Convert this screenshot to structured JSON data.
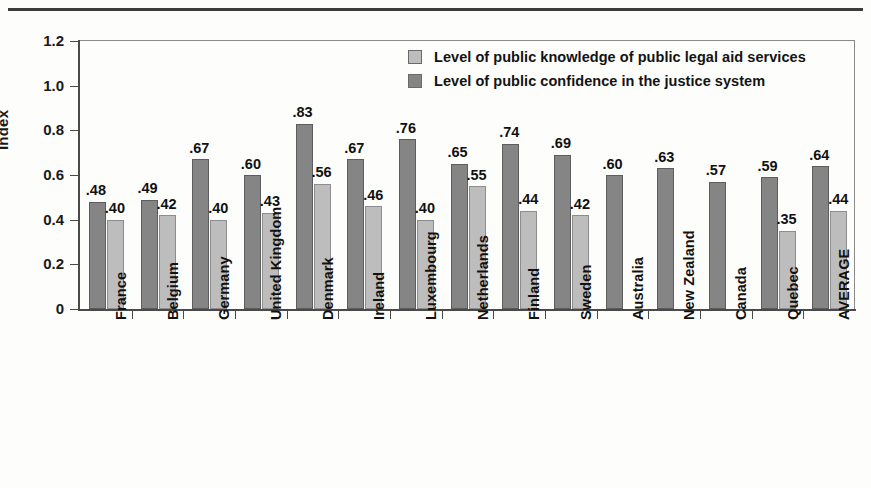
{
  "chart_data": {
    "type": "bar",
    "title": "",
    "xlabel": "",
    "ylabel": "Index",
    "ylim": [
      0,
      1.2
    ],
    "yticks": [
      "0",
      "0.2",
      "0.4",
      "0.6",
      "0.8",
      "1.0",
      "1.2"
    ],
    "ytick_values": [
      0,
      0.2,
      0.4,
      0.6,
      0.8,
      1.0,
      1.2
    ],
    "grid": false,
    "legend_position": "top-right",
    "categories": [
      "France",
      "Belgium",
      "Germany",
      "United Kingdom",
      "Denmark",
      "Ireland",
      "Luxembourg",
      "Netherlands",
      "Finland",
      "Sweden",
      "Australia",
      "New Zealand",
      "Canada",
      "Quebec",
      "AVERAGE"
    ],
    "series": [
      {
        "name": "Level of public confidence in the justice system",
        "color": "#858585",
        "values": [
          0.48,
          0.49,
          0.67,
          0.6,
          0.83,
          0.67,
          0.76,
          0.65,
          0.74,
          0.69,
          0.6,
          0.63,
          0.57,
          0.59,
          0.64
        ],
        "labels": [
          ".48",
          ".49",
          ".67",
          ".60",
          ".83",
          ".67",
          ".76",
          ".65",
          ".74",
          ".69",
          ".60",
          ".63",
          ".57",
          ".59",
          ".64"
        ]
      },
      {
        "name": "Level of public knowledge of public legal aid services",
        "color": "#bdbdbd",
        "values": [
          0.4,
          0.42,
          0.4,
          0.43,
          0.56,
          0.46,
          0.4,
          0.55,
          0.44,
          0.42,
          null,
          null,
          null,
          0.35,
          0.44
        ],
        "labels": [
          ".40",
          ".42",
          ".40",
          ".43",
          ".56",
          ".46",
          ".40",
          ".55",
          ".44",
          ".42",
          "",
          "",
          "",
          ".35",
          ".44"
        ]
      }
    ]
  },
  "legend": {
    "items": [
      {
        "label": "Level of public knowledge of public legal aid services",
        "swatch": "light"
      },
      {
        "label": "Level of public confidence in the justice system",
        "swatch": "dark"
      }
    ]
  },
  "axis": {
    "y_title": "Index"
  }
}
